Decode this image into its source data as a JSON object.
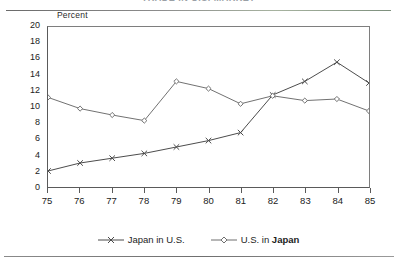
{
  "figure": {
    "title_partial": "TRADE IN U.S. MARKET",
    "y_axis_title": "Percent"
  },
  "chart_data": {
    "type": "line",
    "title": "",
    "xlabel": "",
    "ylabel": "Percent",
    "categories": [
      "75",
      "76",
      "77",
      "78",
      "79",
      "80",
      "81",
      "82",
      "83",
      "84",
      "85"
    ],
    "x": [
      75,
      76,
      77,
      78,
      79,
      80,
      81,
      82,
      83,
      84,
      85
    ],
    "ylim": [
      0,
      20
    ],
    "yticks": [
      0,
      2,
      4,
      6,
      8,
      10,
      12,
      14,
      16,
      18,
      20
    ],
    "xlim": [
      75,
      85
    ],
    "grid": false,
    "legend_position": "bottom-center",
    "series": [
      {
        "name": "Japan in U.S.",
        "marker": "x",
        "color": "#4a4a4a",
        "values": [
          2.0,
          3.0,
          3.6,
          4.2,
          5.0,
          5.8,
          6.8,
          11.5,
          13.2,
          15.6,
          13.0
        ]
      },
      {
        "name": "U.S. in Japan",
        "marker": "diamond",
        "color": "#6f6f6f",
        "values": [
          11.2,
          9.8,
          9.0,
          8.3,
          13.2,
          12.3,
          10.4,
          11.4,
          10.8,
          11.0,
          9.5
        ]
      }
    ]
  },
  "legend": {
    "items": [
      {
        "label": "Japan in U.S.",
        "marker": "x-marker"
      },
      {
        "label_plain": "U.S. in ",
        "label_bold": "Japan",
        "label": "U.S. in Japan",
        "marker": "diamond-marker"
      }
    ]
  }
}
